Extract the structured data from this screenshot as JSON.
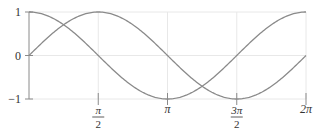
{
  "chart_data": {
    "type": "line",
    "title": "",
    "xlabel": "",
    "ylabel": "",
    "xlim": [
      0,
      6.2832
    ],
    "ylim": [
      -1,
      1
    ],
    "grid": true,
    "legend": "none",
    "x_ticks": [
      {
        "value": 1.5708,
        "label_num": "π",
        "label_den": "2"
      },
      {
        "value": 3.1416,
        "label_num": "π",
        "label_den": ""
      },
      {
        "value": 4.7124,
        "label_num": "3π",
        "label_den": "2"
      },
      {
        "value": 6.2832,
        "label_num": "2π",
        "label_den": ""
      }
    ],
    "y_ticks": [
      {
        "value": 1,
        "label": "1"
      },
      {
        "value": 0,
        "label": "0"
      },
      {
        "value": -1,
        "label": "−1"
      }
    ],
    "series": [
      {
        "name": "sin(x)",
        "function": "sin",
        "color": "#8a8a8a",
        "x": [
          0,
          0.7854,
          1.5708,
          2.3562,
          3.1416,
          3.927,
          4.7124,
          5.4978,
          6.2832
        ],
        "values": [
          0,
          0.707,
          1,
          0.707,
          0,
          -0.707,
          -1,
          -0.707,
          0
        ]
      },
      {
        "name": "cos(x)",
        "function": "cos",
        "color": "#8a8a8a",
        "x": [
          0,
          0.7854,
          1.5708,
          2.3562,
          3.1416,
          3.927,
          4.7124,
          5.4978,
          6.2832
        ],
        "values": [
          1,
          0.707,
          0,
          -0.707,
          -1,
          -0.707,
          0,
          0.707,
          1
        ]
      }
    ]
  },
  "colors": {
    "curve": "#8a8a8a",
    "axis": "#8a8a8a",
    "grid": "#e8e8e8",
    "text": "#333333"
  }
}
